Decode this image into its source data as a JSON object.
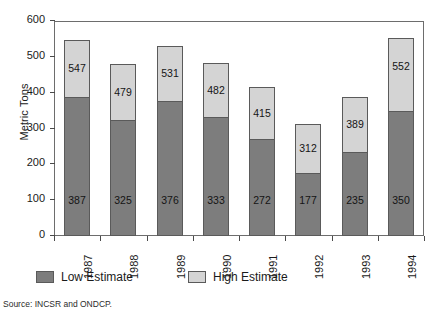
{
  "chart_data": {
    "type": "bar",
    "stacked": true,
    "title": "",
    "xlabel": "",
    "ylabel": "Metric Tons",
    "ylim": [
      0,
      600
    ],
    "ytick_step": 100,
    "yticks": [
      600,
      500,
      400,
      300,
      200,
      100,
      0
    ],
    "grid": false,
    "legend_position": "bottom",
    "categories": [
      "1987",
      "1988",
      "1989",
      "1990",
      "1991",
      "1992",
      "1993",
      "1994"
    ],
    "series": [
      {
        "name": "Low Estimate",
        "color": "#7d7d7d",
        "values": [
          387,
          325,
          376,
          333,
          272,
          177,
          235,
          350
        ]
      },
      {
        "name": "High Estimate",
        "color": "#d4d4d4",
        "values": [
          547,
          479,
          531,
          482,
          415,
          312,
          389,
          552
        ]
      }
    ],
    "note": "High Estimate values are bar totals; the light segment spans from the Low Estimate to the High Estimate."
  },
  "axis": {
    "y_title": "Metric Tons",
    "y_labels": [
      "600",
      "500",
      "400",
      "300",
      "200",
      "100",
      "0"
    ],
    "x_labels": [
      "1987",
      "1988",
      "1989",
      "1990",
      "1991",
      "1992",
      "1993",
      "1994"
    ]
  },
  "bar_labels": {
    "low": [
      "387",
      "325",
      "376",
      "333",
      "272",
      "177",
      "235",
      "350"
    ],
    "high": [
      "547",
      "479",
      "531",
      "482",
      "415",
      "312",
      "389",
      "552"
    ]
  },
  "legend": {
    "items": [
      {
        "label": "Low Estimate",
        "color": "#7d7d7d"
      },
      {
        "label": "High Estimate",
        "color": "#d4d4d4"
      }
    ]
  },
  "footer": {
    "source": "Source: INCSR and ONDCP."
  }
}
